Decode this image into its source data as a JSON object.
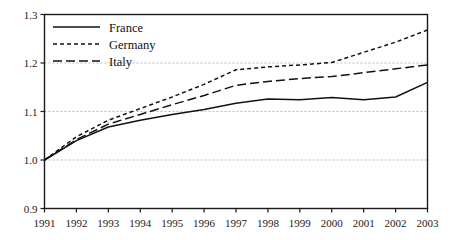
{
  "chart_data": {
    "type": "line",
    "title": "",
    "xlabel": "",
    "ylabel": "",
    "x": [
      1991,
      1992,
      1993,
      1994,
      1995,
      1996,
      1997,
      1998,
      1999,
      2000,
      2001,
      2002,
      2003
    ],
    "xlim": [
      1991,
      2003
    ],
    "ylim": [
      0.9,
      1.3
    ],
    "yticks": [
      0.9,
      1.0,
      1.1,
      1.2,
      1.3
    ],
    "ytick_labels": [
      "0.9",
      "1.0",
      "1.1",
      "1.2",
      "1.3"
    ],
    "xticks": [
      1991,
      1992,
      1993,
      1994,
      1995,
      1996,
      1997,
      1998,
      1999,
      2000,
      2001,
      2002,
      2003
    ],
    "xtick_labels": [
      "1991",
      "1992",
      "1993",
      "1994",
      "1995",
      "1996",
      "1997",
      "1998",
      "1999",
      "2000",
      "2001",
      "2002",
      "2003"
    ],
    "grid": "horizontal-dashed-light",
    "grid_color": "#bbbbbb",
    "legend_position": "top-left",
    "line_color": "#111111",
    "series": [
      {
        "name": "France",
        "style": "solid",
        "dasharray": "",
        "values": [
          1.0,
          1.04,
          1.068,
          1.082,
          1.094,
          1.104,
          1.117,
          1.126,
          1.124,
          1.129,
          1.124,
          1.13,
          1.16
        ]
      },
      {
        "name": "Germany",
        "style": "short-dashed",
        "dasharray": "4,3",
        "values": [
          1.0,
          1.048,
          1.082,
          1.106,
          1.13,
          1.156,
          1.186,
          1.192,
          1.196,
          1.201,
          1.222,
          1.243,
          1.268
        ]
      },
      {
        "name": "Italy",
        "style": "long-dashed",
        "dasharray": "9,4",
        "values": [
          1.0,
          1.042,
          1.074,
          1.094,
          1.114,
          1.133,
          1.154,
          1.162,
          1.168,
          1.172,
          1.18,
          1.188,
          1.196
        ]
      }
    ]
  },
  "legend": {
    "entries": [
      {
        "label": "France"
      },
      {
        "label": "Germany"
      },
      {
        "label": "Italy"
      }
    ]
  }
}
